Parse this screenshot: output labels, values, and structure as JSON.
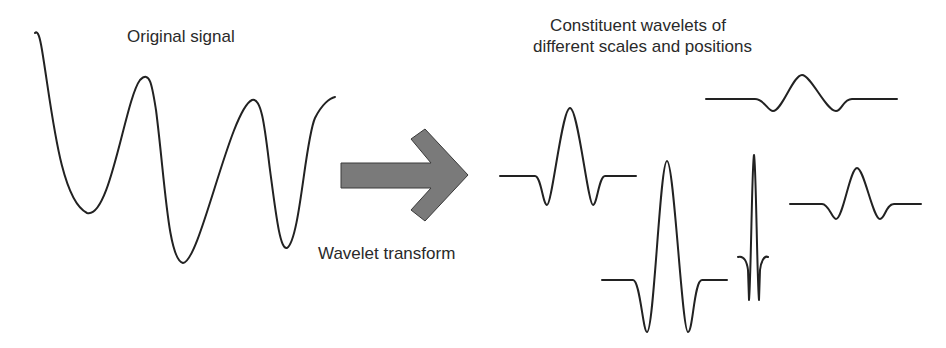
{
  "labels": {
    "original_signal": "Original signal",
    "transform": "Wavelet transform",
    "constituent_line1": "Constituent wavelets of",
    "constituent_line2": "different scales and positions"
  },
  "colors": {
    "stroke": "#222222",
    "arrow_fill": "#7a7a7a",
    "arrow_stroke": "#3a3a3a",
    "background": "#ffffff"
  },
  "elements": {
    "original_signal_curve": "decaying oscillating waveform",
    "arrow": "right-pointing block arrow",
    "wavelets": [
      {
        "id": "wavelet-medium-left",
        "scale": "medium",
        "position": "left"
      },
      {
        "id": "wavelet-wide-top",
        "scale": "wide",
        "position": "top-right"
      },
      {
        "id": "wavelet-large-tall",
        "scale": "large amplitude",
        "position": "bottom-center"
      },
      {
        "id": "wavelet-narrow",
        "scale": "narrow",
        "position": "center"
      },
      {
        "id": "wavelet-small-right",
        "scale": "small",
        "position": "right"
      }
    ]
  }
}
